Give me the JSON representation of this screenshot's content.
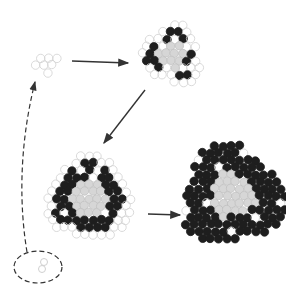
{
  "diagram": {
    "colors": {
      "background": "#ffffff",
      "open_circle_stroke": "#d0d0d0",
      "gray_fill": "#d6d6d6",
      "gray_stroke": "#c0c0c0",
      "black_fill": "#1e1e1e",
      "arrow": "#333333",
      "dashed": "#333333"
    },
    "stages": [
      {
        "id": "stage-1",
        "name": "seed-cluster",
        "center": [
          48,
          63
        ],
        "radius": 12,
        "composition": "open circles only"
      },
      {
        "id": "stage-2",
        "name": "small-cluster",
        "center": [
          172,
          55
        ],
        "radius": 30,
        "composition": "gray core, partial black ring, open outer"
      },
      {
        "id": "stage-3",
        "name": "medium-cluster",
        "center": [
          90,
          198
        ],
        "radius": 42,
        "composition": "gray core, black ring, open outer"
      },
      {
        "id": "stage-4",
        "name": "large-cluster",
        "center": [
          232,
          196
        ],
        "radius": 50,
        "composition": "gray core, dense black outer"
      }
    ],
    "arrows": [
      {
        "from": "stage-1",
        "to": "stage-2",
        "style": "solid"
      },
      {
        "from": "stage-2",
        "to": "stage-3",
        "style": "solid"
      },
      {
        "from": "stage-3",
        "to": "stage-4",
        "style": "solid"
      },
      {
        "from": "ellipse",
        "to": "stage-1",
        "style": "dashed"
      }
    ],
    "ellipse": {
      "center": [
        38,
        267
      ],
      "rx": 24,
      "ry": 16,
      "style": "dashed"
    }
  }
}
